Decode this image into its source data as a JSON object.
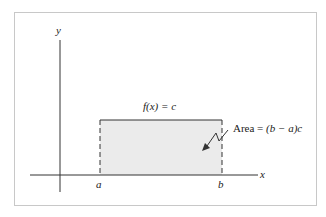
{
  "diagram": {
    "function_label": "f(x) = c",
    "area_label_prefix": "Area = ",
    "area_label_expr": "(b − a)c",
    "axis_x_label": "x",
    "axis_y_label": "y",
    "point_a_label": "a",
    "point_b_label": "b",
    "colors": {
      "fill": "#ebebeb",
      "stroke": "#333333",
      "frame": "#c8c8c8"
    }
  }
}
